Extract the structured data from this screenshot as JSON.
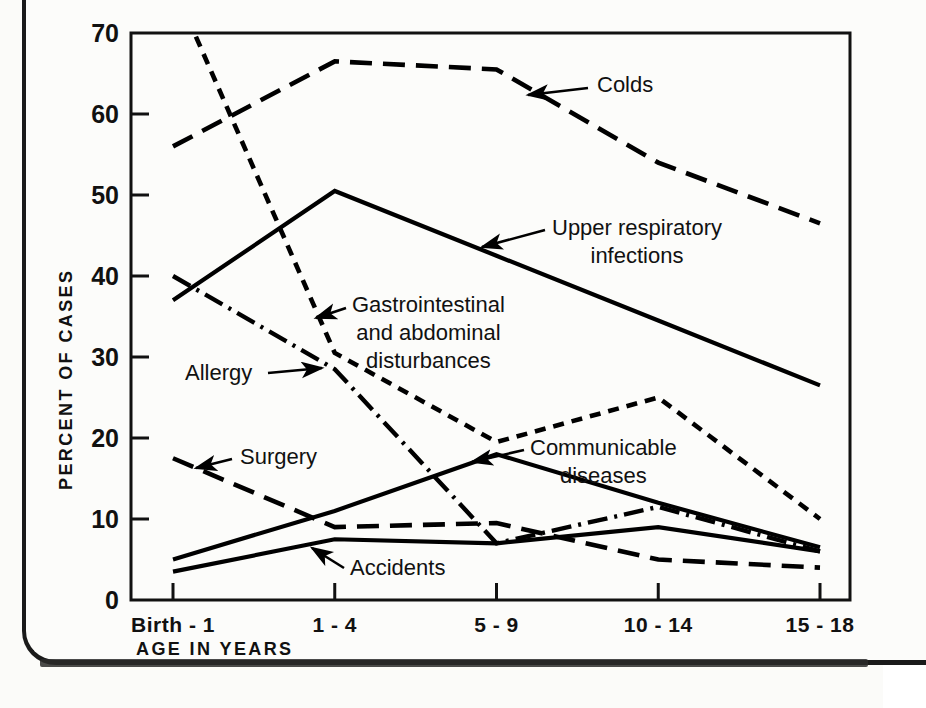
{
  "chart_data": {
    "type": "line",
    "title": "",
    "xlabel": "AGE IN YEARS",
    "ylabel": "PERCENT OF CASES",
    "categories": [
      "Birth - 1",
      "1 - 4",
      "5 - 9",
      "10 - 14",
      "15 - 18"
    ],
    "ylim": [
      0,
      70
    ],
    "xlim_note": "categorical, 5 evenly spaced age groups",
    "yticks": [
      "0",
      "10",
      "20",
      "30",
      "40",
      "50",
      "60",
      "70"
    ],
    "ytick_values": [
      0,
      10,
      20,
      30,
      40,
      50,
      60,
      70
    ],
    "grid": false,
    "legend": "none (series labeled in-place with leader arrows)",
    "series": [
      {
        "name": "Colds",
        "style": "long-dash",
        "values": [
          56,
          66.5,
          65.5,
          54,
          46.5
        ],
        "label": "Colds",
        "label_x": 597,
        "label_y": 92,
        "leader_from_x": 588,
        "leader_from_y": 88,
        "leader_to_x": 528,
        "leader_to_y": 95
      },
      {
        "name": "Upper respiratory infections",
        "style": "solid",
        "values": [
          37,
          50.5,
          42.5,
          34.5,
          26.5
        ],
        "label": "Upper respiratory",
        "label2": "infections",
        "label_x": 552,
        "label_y": 235,
        "label2_x": 552,
        "label2_y": 263,
        "leader_from_x": 545,
        "leader_from_y": 230,
        "leader_to_x": 482,
        "leader_to_y": 247
      },
      {
        "name": "Gastrointestinal and abdominal disturbances",
        "style": "short-dash",
        "values": [
          76,
          30.5,
          19.5,
          25,
          10
        ],
        "label": "Gastrointestinal",
        "label2": "and abdominal",
        "label3": "disturbances",
        "label_x": 352,
        "label_y": 312,
        "label2_x": 352,
        "label2_y": 340,
        "label3_x": 352,
        "label3_y": 368,
        "leader_from_x": 346,
        "leader_from_y": 308,
        "leader_to_x": 316,
        "leader_to_y": 318
      },
      {
        "name": "Allergy",
        "style": "dash-dot",
        "values": [
          40,
          28.5,
          7,
          11.5,
          6
        ],
        "label": "Allergy",
        "label_x": 185,
        "label_y": 380,
        "leader_from_x": 268,
        "leader_from_y": 373,
        "leader_to_x": 322,
        "leader_to_y": 368
      },
      {
        "name": "Communicable diseases",
        "style": "solid",
        "values": [
          5,
          11,
          18,
          12,
          6.5
        ],
        "label": "Communicable",
        "label2": "diseases",
        "label_x": 530,
        "label_y": 455,
        "label2_x": 530,
        "label2_y": 483,
        "leader_from_x": 524,
        "leader_from_y": 450,
        "leader_to_x": 472,
        "leader_to_y": 462
      },
      {
        "name": "Surgery",
        "style": "long-dash",
        "values": [
          17.5,
          9,
          9.5,
          5,
          4
        ],
        "label": "Surgery",
        "label_x": 240,
        "label_y": 464,
        "leader_from_x": 232,
        "leader_from_y": 459,
        "leader_to_x": 196,
        "leader_to_y": 468
      },
      {
        "name": "Accidents",
        "style": "solid",
        "values": [
          3.5,
          7.5,
          7,
          9,
          6
        ],
        "label": "Accidents",
        "label_x": 350,
        "label_y": 575,
        "leader_from_x": 344,
        "leader_from_y": 568,
        "leader_to_x": 312,
        "leader_to_y": 548
      }
    ],
    "colors": {
      "ink": "#000000",
      "paper": "#fbfbf9",
      "frame": "#1a1a1a"
    }
  }
}
